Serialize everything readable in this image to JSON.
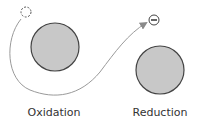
{
  "diagram": {
    "labels": {
      "left": "Oxidation",
      "right": "Reduction"
    },
    "electron_symbol": "−",
    "colors": {
      "atom_fill": "#c8c8c8",
      "atom_stroke": "#444444",
      "path_stroke": "#9a9a9a",
      "text": "#333333"
    }
  }
}
